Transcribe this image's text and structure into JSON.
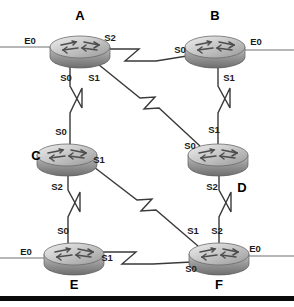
{
  "diagram": {
    "type": "network-topology",
    "device_icon": "cisco-router-icon",
    "link_icon": "serial-lightning-bolt-icon",
    "colors": {
      "background": "#ffffff",
      "link": "#3a3a3a",
      "stub": "#707070",
      "label": "#000000",
      "router_body_light": "#e8e8e8",
      "router_body_mid": "#b4b4b4",
      "router_body_dark": "#7a7a7a",
      "bottom_bar": "#0a0a0a"
    },
    "routers": [
      {
        "id": "A",
        "name": "A",
        "cx": 80,
        "cy": 47,
        "name_x": 80,
        "name_y": 20,
        "ports": [
          {
            "name": "E0",
            "x": 30,
            "y": 41,
            "anchor": "middle"
          },
          {
            "name": "S2",
            "x": 109,
            "y": 41,
            "anchor": "middle"
          },
          {
            "name": "S0",
            "x": 66,
            "y": 79,
            "anchor": "middle"
          },
          {
            "name": "S1",
            "x": 93,
            "y": 79,
            "anchor": "middle"
          }
        ]
      },
      {
        "id": "B",
        "name": "B",
        "cx": 215,
        "cy": 47,
        "name_x": 215,
        "name_y": 20,
        "ports": [
          {
            "name": "S0",
            "x": 180,
            "y": 50,
            "anchor": "middle"
          },
          {
            "name": "E0",
            "x": 255,
            "y": 43,
            "anchor": "middle"
          },
          {
            "name": "S1",
            "x": 228,
            "y": 79,
            "anchor": "middle"
          }
        ]
      },
      {
        "id": "C",
        "name": "C",
        "cx": 67,
        "cy": 155,
        "name_x": 36,
        "name_y": 157,
        "ports": [
          {
            "name": "S0",
            "x": 61,
            "y": 132,
            "anchor": "middle"
          },
          {
            "name": "S1",
            "x": 97,
            "y": 161,
            "anchor": "middle"
          },
          {
            "name": "S2",
            "x": 57,
            "y": 187,
            "anchor": "middle"
          }
        ]
      },
      {
        "id": "D",
        "name": "D",
        "cx": 218,
        "cy": 155,
        "name_x": 242,
        "name_y": 188,
        "ports": [
          {
            "name": "S1",
            "x": 213,
            "y": 130,
            "anchor": "middle"
          },
          {
            "name": "S0",
            "x": 190,
            "y": 146,
            "anchor": "middle"
          },
          {
            "name": "S2",
            "x": 212,
            "y": 187,
            "anchor": "middle"
          }
        ]
      },
      {
        "id": "E",
        "name": "E",
        "cx": 74,
        "cy": 254,
        "name_x": 74,
        "name_y": 285,
        "ports": [
          {
            "name": "S0",
            "x": 63,
            "y": 231,
            "anchor": "middle"
          },
          {
            "name": "E0",
            "x": 26,
            "y": 252,
            "anchor": "middle"
          },
          {
            "name": "S1",
            "x": 106,
            "y": 258,
            "anchor": "middle"
          }
        ]
      },
      {
        "id": "F",
        "name": "F",
        "cx": 219,
        "cy": 254,
        "name_x": 219,
        "name_y": 285,
        "ports": [
          {
            "name": "S1",
            "x": 193,
            "y": 231,
            "anchor": "middle"
          },
          {
            "name": "S2",
            "x": 216,
            "y": 231,
            "anchor": "middle"
          },
          {
            "name": "E0",
            "x": 254,
            "y": 249,
            "anchor": "middle"
          },
          {
            "name": "S0",
            "x": 191,
            "y": 269,
            "anchor": "middle"
          }
        ]
      }
    ],
    "links": [
      {
        "id": "A-B",
        "from": "A",
        "from_port": "S2",
        "to": "B",
        "to_port": "S0",
        "kind": "serial"
      },
      {
        "id": "A-C",
        "from": "A",
        "from_port": "S0",
        "to": "C",
        "to_port": "S0",
        "kind": "serial"
      },
      {
        "id": "A-D",
        "from": "A",
        "from_port": "S1",
        "to": "D",
        "to_port": "S0",
        "kind": "serial"
      },
      {
        "id": "B-D",
        "from": "B",
        "from_port": "S1",
        "to": "D",
        "to_port": "S1",
        "kind": "serial"
      },
      {
        "id": "C-E",
        "from": "C",
        "from_port": "S2",
        "to": "E",
        "to_port": "S0",
        "kind": "serial"
      },
      {
        "id": "C-F",
        "from": "C",
        "from_port": "S1",
        "to": "F",
        "to_port": "S1",
        "kind": "serial"
      },
      {
        "id": "D-F",
        "from": "D",
        "from_port": "S2",
        "to": "F",
        "to_port": "S2",
        "kind": "serial"
      },
      {
        "id": "E-F",
        "from": "E",
        "from_port": "S1",
        "to": "F",
        "to_port": "S0",
        "kind": "serial"
      }
    ],
    "lan_stubs": [
      {
        "id": "A-E0",
        "router": "A",
        "port": "E0",
        "side": "left"
      },
      {
        "id": "B-E0",
        "router": "B",
        "port": "E0",
        "side": "right"
      },
      {
        "id": "E-E0",
        "router": "E",
        "port": "E0",
        "side": "left"
      },
      {
        "id": "F-E0",
        "router": "F",
        "port": "E0",
        "side": "right"
      }
    ]
  }
}
